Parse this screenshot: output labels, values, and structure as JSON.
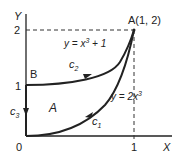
{
  "diagram": {
    "axes": {
      "x_label": "X",
      "y_label": "Y",
      "origin_label": "0",
      "x_ticks": [
        "1"
      ],
      "y_ticks": [
        "1",
        "2"
      ]
    },
    "points": {
      "A": {
        "label": "A(1, 2)",
        "x": 1,
        "y": 2
      },
      "B": {
        "label": "B",
        "x": 0,
        "y": 1
      }
    },
    "curves": {
      "c1": {
        "label": "c",
        "sub": "1",
        "equation_prefix": "y = 2x",
        "equation_exp": "3",
        "equation_suffix": ""
      },
      "c2": {
        "label": "c",
        "sub": "2",
        "equation_prefix": "y = x",
        "equation_exp": "3",
        "equation_suffix": " + 1"
      },
      "c3": {
        "label": "c",
        "sub": "3"
      }
    },
    "region_label": "A",
    "colors": {
      "line": "#222222",
      "dashed": "#333333",
      "background": "#ffffff"
    }
  }
}
